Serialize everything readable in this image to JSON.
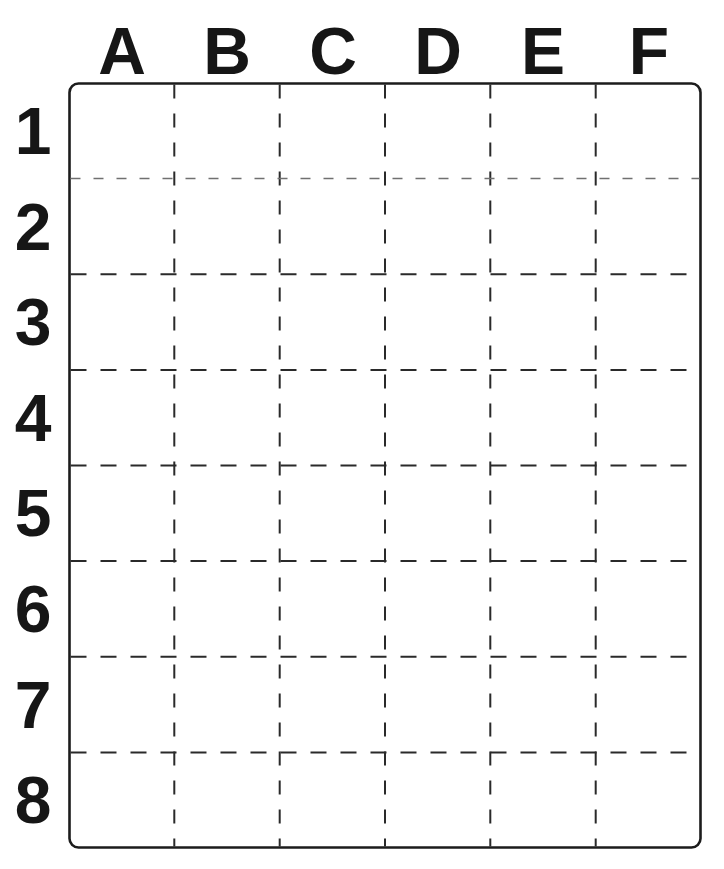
{
  "grid": {
    "columns": [
      "A",
      "B",
      "C",
      "D",
      "E",
      "F"
    ],
    "rows": [
      "1",
      "2",
      "3",
      "4",
      "5",
      "6",
      "7",
      "8"
    ],
    "num_columns": 6,
    "num_rows": 8
  },
  "colors": {
    "background": "#ffffff",
    "ink": "#1c1c1c",
    "line": "#2a2a2a",
    "faint_line": "#707070",
    "label": "#161616"
  }
}
